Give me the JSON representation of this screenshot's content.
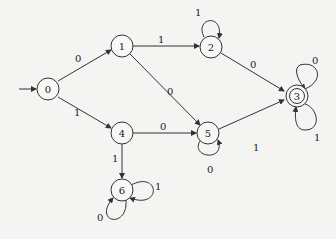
{
  "diagram": {
    "type": "finite-state-automaton",
    "start_state": "0",
    "accepting_states": [
      "3"
    ],
    "states": [
      {
        "id": "0",
        "label": "0"
      },
      {
        "id": "1",
        "label": "1"
      },
      {
        "id": "2",
        "label": "2"
      },
      {
        "id": "3",
        "label": "3"
      },
      {
        "id": "4",
        "label": "4"
      },
      {
        "id": "5",
        "label": "5"
      },
      {
        "id": "6",
        "label": "6"
      }
    ],
    "transitions": [
      {
        "from": "0",
        "to": "1",
        "label": "0"
      },
      {
        "from": "0",
        "to": "4",
        "label": "1"
      },
      {
        "from": "1",
        "to": "2",
        "label": "1"
      },
      {
        "from": "1",
        "to": "5",
        "label": "0"
      },
      {
        "from": "2",
        "to": "2",
        "label": "1"
      },
      {
        "from": "2",
        "to": "3",
        "label": "0"
      },
      {
        "from": "3",
        "to": "3",
        "label": "0"
      },
      {
        "from": "3",
        "to": "3",
        "label": "1"
      },
      {
        "from": "4",
        "to": "5",
        "label": "0"
      },
      {
        "from": "4",
        "to": "6",
        "label": "1"
      },
      {
        "from": "5",
        "to": "3",
        "label": "1"
      },
      {
        "from": "5",
        "to": "5",
        "label": "0"
      },
      {
        "from": "6",
        "to": "6",
        "label": "1"
      },
      {
        "from": "6",
        "to": "6",
        "label": "0"
      }
    ]
  }
}
